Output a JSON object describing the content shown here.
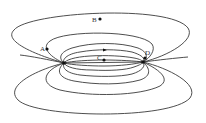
{
  "diagram": {
    "type": "field-lines",
    "colors": {
      "line": "#3a3a3a",
      "point": "#111111",
      "label": "#333333"
    },
    "poles": [
      {
        "name": "left-pole",
        "x": 64,
        "y": 63
      },
      {
        "name": "right-pole",
        "x": 143,
        "y": 62
      }
    ],
    "points": [
      {
        "label": "A",
        "x": 47,
        "y": 49,
        "label_x": 40,
        "label_y": 50
      },
      {
        "label": "B",
        "x": 100,
        "y": 19,
        "label_x": 92,
        "label_y": 22
      },
      {
        "label": "C",
        "x": 104,
        "y": 60,
        "label_x": 97,
        "label_y": 60
      },
      {
        "label": "D",
        "x": 145,
        "y": 58,
        "label_x": 145,
        "label_y": 55
      }
    ],
    "arrow": {
      "x": 105,
      "y": 50,
      "direction": "right"
    }
  }
}
